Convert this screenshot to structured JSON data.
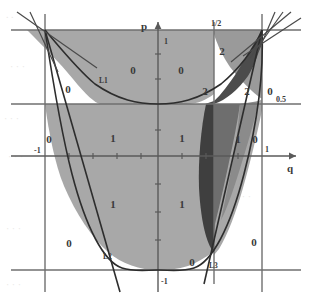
{
  "figure": {
    "title": "",
    "axes": {
      "x_label": "q",
      "y_label": "p",
      "ticks": {
        "y_one": "1",
        "y_minus_one": "-1",
        "x_minus_one": "-1",
        "x_one": "1",
        "x_half": "1/2",
        "y_half": "0.5"
      }
    },
    "curve_labels": {
      "l1": "L1",
      "l2": "L2",
      "l3": "L3"
    },
    "regions": [
      {
        "label": "0",
        "x": 133,
        "y": 74
      },
      {
        "label": "0",
        "x": 181,
        "y": 74
      },
      {
        "label": "0",
        "x": 68,
        "y": 93
      },
      {
        "label": "0",
        "x": 49,
        "y": 143
      },
      {
        "label": "1",
        "x": 113,
        "y": 142
      },
      {
        "label": "1",
        "x": 182,
        "y": 142
      },
      {
        "label": "1",
        "x": 113,
        "y": 208
      },
      {
        "label": "1",
        "x": 182,
        "y": 208
      },
      {
        "label": "0",
        "x": 69,
        "y": 247
      },
      {
        "label": "0",
        "x": 192,
        "y": 266
      },
      {
        "label": "0",
        "x": 254,
        "y": 246
      },
      {
        "label": "0",
        "x": 255,
        "y": 143
      },
      {
        "label": "1",
        "x": 238,
        "y": 143
      },
      {
        "label": "2",
        "x": 222,
        "y": 55
      },
      {
        "label": "2",
        "x": 205,
        "y": 95
      },
      {
        "label": "2",
        "x": 247,
        "y": 95
      },
      {
        "label": "0",
        "x": 270,
        "y": 95
      }
    ]
  },
  "chart_data": {
    "type": "scatter",
    "title": "",
    "xlabel": "q",
    "ylabel": "p",
    "xlim": [
      -1.35,
      1.35
    ],
    "ylim": [
      -1.3,
      1.3
    ],
    "grid": true,
    "legend": "none",
    "annotations": [
      "L1",
      "L2",
      "L3"
    ],
    "tick_labels_x": [
      "-1",
      "1/2",
      "1"
    ],
    "tick_labels_y": [
      "1",
      "0.5",
      "-1"
    ],
    "region_labels": [
      "0",
      "1",
      "2"
    ],
    "series": [
      {
        "name": "parabola L2 (p = q^2/4 boundary, lower)",
        "type": "curve"
      },
      {
        "name": "parabola L1 (upper boundary)",
        "type": "curve"
      },
      {
        "name": "line L3",
        "type": "line"
      }
    ]
  }
}
